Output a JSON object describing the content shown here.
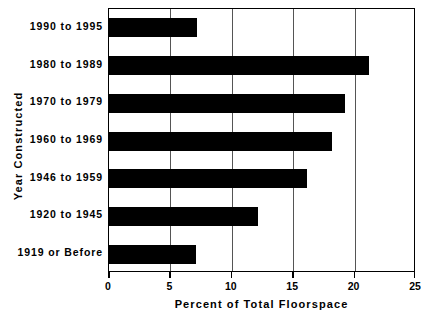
{
  "chart_data": {
    "type": "bar",
    "orientation": "horizontal",
    "title": "",
    "xlabel": "Percent of Total Floorspace",
    "ylabel": "Year Constructed",
    "categories": [
      "1990 to 1995",
      "1980 to 1989",
      "1970 to 1979",
      "1960 to 1969",
      "1946 to 1959",
      "1920 to 1945",
      "1919 or Before"
    ],
    "values": [
      7.2,
      21.2,
      19.2,
      18.2,
      16.1,
      12.1,
      7.1
    ],
    "xlim": [
      0,
      25
    ],
    "xticks": [
      0,
      5,
      10,
      15,
      20,
      25
    ],
    "xtick_labels": [
      "0",
      "5",
      "10",
      "15",
      "20",
      "25"
    ],
    "gridlines_x": [
      5,
      10,
      15,
      20
    ],
    "grid": true,
    "legend": null,
    "bar_color": "#000000",
    "grid_color": "#555555",
    "axis_color": "#000000",
    "background_color": "#ffffff"
  }
}
